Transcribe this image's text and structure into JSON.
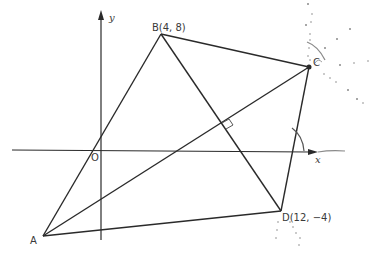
{
  "diagram": {
    "type": "coordinate-geometry-quadrilateral",
    "axes": {
      "x_label": "x",
      "y_label": "y",
      "origin_label": "O"
    },
    "points": [
      {
        "name": "A",
        "label": "A"
      },
      {
        "name": "B",
        "label": "B(4, 8)"
      },
      {
        "name": "C",
        "label": "C"
      },
      {
        "name": "D",
        "label": "D(12, −4)"
      }
    ],
    "segments": [
      "AB",
      "BC",
      "CD",
      "DA",
      "AC",
      "BD"
    ],
    "annotations": [
      "right angle at intersection of AC and BD",
      "angle arc between CD and x-axis",
      "construction arcs at C and D"
    ],
    "colors": {
      "line": "#2a2a2a",
      "construction": "#8a8a8a"
    }
  }
}
